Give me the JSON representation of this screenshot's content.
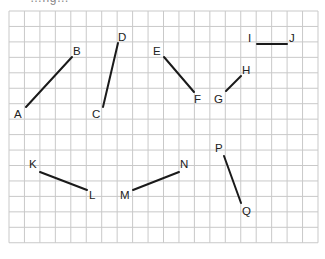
{
  "figure": {
    "cutoff_caption": "…ng…",
    "grid": {
      "left": 9,
      "top": 11,
      "cols": 20,
      "rows": 15,
      "cell": 15.45,
      "line_color": "#c9c9c9",
      "background": "#ffffff"
    },
    "segment_color": "#1a1a1a",
    "label_color": "#222222",
    "segments": [
      {
        "name": "AB",
        "from": {
          "label": "A",
          "x": 26,
          "y": 107,
          "lx": 14,
          "ly": 118
        },
        "to": {
          "label": "B",
          "x": 72,
          "y": 57,
          "lx": 73,
          "ly": 55
        }
      },
      {
        "name": "CD",
        "from": {
          "label": "C",
          "x": 103,
          "y": 107,
          "lx": 92,
          "ly": 118
        },
        "to": {
          "label": "D",
          "x": 118,
          "y": 43,
          "lx": 118,
          "ly": 41
        }
      },
      {
        "name": "EF",
        "from": {
          "label": "E",
          "x": 164,
          "y": 57,
          "lx": 153,
          "ly": 55
        },
        "to": {
          "label": "F",
          "x": 194,
          "y": 92,
          "lx": 194,
          "ly": 103
        }
      },
      {
        "name": "GH",
        "from": {
          "label": "G",
          "x": 226,
          "y": 91,
          "lx": 214,
          "ly": 103
        },
        "to": {
          "label": "H",
          "x": 241,
          "y": 76,
          "lx": 242,
          "ly": 74
        }
      },
      {
        "name": "IJ",
        "from": {
          "label": "I",
          "x": 257,
          "y": 44,
          "lx": 248,
          "ly": 42
        },
        "to": {
          "label": "J",
          "x": 287,
          "y": 44,
          "lx": 289,
          "ly": 42
        }
      },
      {
        "name": "KL",
        "from": {
          "label": "K",
          "x": 40,
          "y": 172,
          "lx": 29,
          "ly": 168
        },
        "to": {
          "label": "L",
          "x": 87,
          "y": 190,
          "lx": 89,
          "ly": 199
        }
      },
      {
        "name": "MN",
        "from": {
          "label": "M",
          "x": 133,
          "y": 190,
          "lx": 120,
          "ly": 199
        },
        "to": {
          "label": "N",
          "x": 179,
          "y": 172,
          "lx": 180,
          "ly": 168
        }
      },
      {
        "name": "PQ",
        "from": {
          "label": "P",
          "x": 224,
          "y": 156,
          "lx": 215,
          "ly": 152
        },
        "to": {
          "label": "Q",
          "x": 241,
          "y": 203,
          "lx": 242,
          "ly": 215
        }
      }
    ]
  }
}
